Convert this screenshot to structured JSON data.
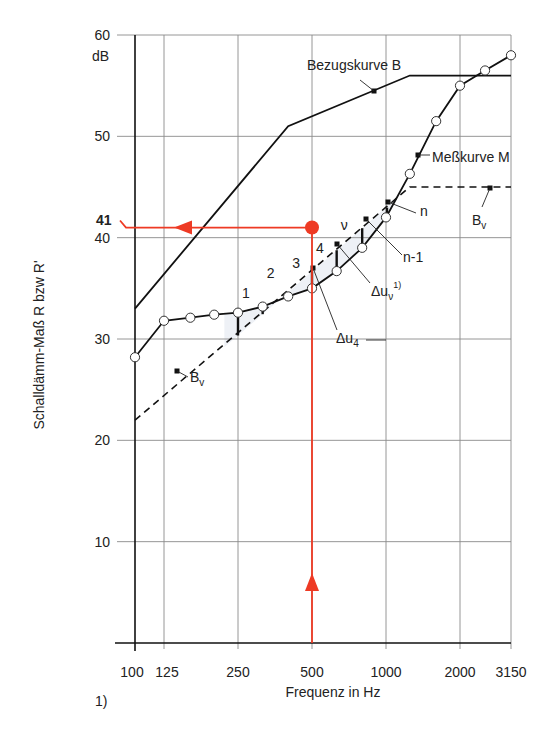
{
  "chart_data": {
    "type": "line",
    "title": "",
    "xlabel": "Frequenz in Hz",
    "ylabel": "Schalldämm-Maß R bzw R'",
    "y_unit": "dB",
    "x_scale": "log",
    "xlim": [
      100,
      3150
    ],
    "ylim": [
      0,
      60
    ],
    "x_ticks": [
      100,
      125,
      250,
      500,
      1000,
      2000,
      3150
    ],
    "x_tick_labels": [
      "100",
      "125",
      "250",
      "500",
      "1000",
      "2000",
      "3150"
    ],
    "y_ticks": [
      10,
      20,
      30,
      40,
      50,
      60
    ],
    "y_tick_labels": [
      "10",
      "20",
      "30",
      "40",
      "50",
      "60"
    ],
    "grid": true,
    "series": [
      {
        "name": "Bezugskurve B",
        "style": "solid",
        "x": [
          100,
          400,
          1250,
          3150
        ],
        "y": [
          33,
          51,
          56,
          56
        ]
      },
      {
        "name": "Meßkurve M",
        "style": "solid-with-circles",
        "x": [
          100,
          125,
          160,
          200,
          250,
          315,
          400,
          500,
          630,
          800,
          1000,
          1250,
          1600,
          2000,
          2500,
          3150
        ],
        "y": [
          28.2,
          31.8,
          32.1,
          32.4,
          32.6,
          33.2,
          34.2,
          35.0,
          36.7,
          39.0,
          42.0,
          46.3,
          51.5,
          55.0,
          56.5,
          58.0
        ]
      },
      {
        "name": "Bv",
        "style": "dashed",
        "x": [
          100,
          1250,
          3150
        ],
        "y": [
          22,
          45,
          45
        ]
      }
    ],
    "annotations": [
      {
        "text": "41",
        "color": "#ee3a24",
        "at": {
          "x": 500,
          "y": 41
        },
        "note": "Result read at 500 Hz on shifted reference curve Bv"
      },
      {
        "text": "1",
        "type": "deficit-bar",
        "x": 250
      },
      {
        "text": "2",
        "type": "deficit-bar",
        "x": 315
      },
      {
        "text": "3",
        "type": "deficit-bar",
        "x": 400
      },
      {
        "text": "4",
        "type": "deficit-bar",
        "x": 500
      },
      {
        "text": "ν",
        "type": "deficit-bar",
        "x": 630
      },
      {
        "text": "n-1",
        "type": "deficit-bar",
        "x": 800
      },
      {
        "text": "n",
        "type": "deficit-bar",
        "x": 1000
      },
      {
        "text": "Δu4",
        "type": "label"
      },
      {
        "text": "Δuν 1)",
        "type": "label"
      }
    ]
  },
  "labels": {
    "y_unit": "dB",
    "y_axis_title": "Schalldämm-Maß R bzw R'",
    "x_axis_title": "Frequenz in Hz",
    "bezugskurve": "Bezugskurve B",
    "messkurve": "Meßkurve M",
    "bv": "B",
    "bv_sub": "v",
    "result": "41",
    "bar_labels": [
      "1",
      "2",
      "3",
      "4",
      "ν"
    ],
    "n": "n",
    "n_minus_1": "n-1",
    "delta_u4": "Δu",
    "delta_u4_sub": "4",
    "delta_uv": "Δu",
    "delta_uv_sub": "ν",
    "delta_uv_sup": "1)",
    "footnote_marker": "1)"
  },
  "colors": {
    "accent_red": "#ee3a24",
    "line": "#111111",
    "grid": "#8a8a8a",
    "shade": "#eef1f6"
  }
}
